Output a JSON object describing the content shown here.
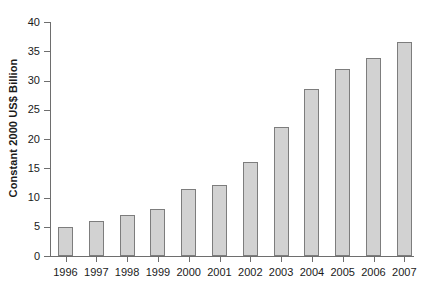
{
  "chart_data": {
    "type": "bar",
    "title": "",
    "subtitle": "",
    "xlabel": "",
    "ylabel": "Constant 2000 US$ Billion",
    "categories": [
      "1996",
      "1997",
      "1998",
      "1999",
      "2000",
      "2001",
      "2002",
      "2003",
      "2004",
      "2005",
      "2006",
      "2007"
    ],
    "values": [
      5.0,
      6.0,
      7.0,
      8.0,
      11.5,
      12.2,
      16.0,
      22.1,
      28.5,
      31.9,
      33.8,
      36.5
    ],
    "ylim": [
      0,
      40
    ],
    "ytick_values": [
      0,
      5,
      10,
      15,
      20,
      25,
      30,
      35,
      40
    ],
    "ytick_labels": [
      "0",
      "5",
      "10",
      "15",
      "20",
      "25",
      "30",
      "35",
      "40"
    ],
    "grid": false,
    "legend": null,
    "legend_position": "none",
    "annotations": [],
    "bar_fill_color": "#d2d2d2",
    "bar_border_color": "#7d7d7d",
    "axis_color": "#6e6e6e",
    "text_color": "#1a1a1a"
  }
}
